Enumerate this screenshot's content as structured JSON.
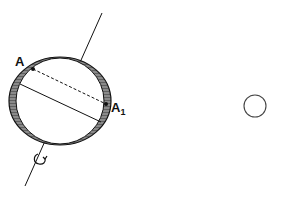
{
  "diagram": {
    "type": "rotating-sphere",
    "labels": {
      "point_a": "A",
      "point_a1_base": "A",
      "point_a1_sub": "1"
    },
    "colors": {
      "stroke": "#111111",
      "shell_fill": "#7a7a7a",
      "inner_fill": "#ffffff",
      "small_circle": "#444444"
    },
    "elements": [
      "rotation-axis",
      "oblate-shell",
      "inner-sphere",
      "point-A",
      "point-A1",
      "dashed-chord",
      "equatorial-diameter",
      "rotation-arrow",
      "small-circle"
    ]
  }
}
